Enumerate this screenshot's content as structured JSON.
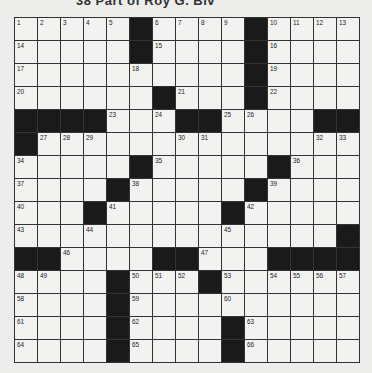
{
  "header": {
    "clue_text": "38 Part of Roy G. Biv"
  },
  "puzzle": {
    "rows": 15,
    "cols": 15,
    "grid": [
      [
        "1",
        "2",
        "3",
        "4",
        "5",
        "#",
        "6",
        "7",
        "8",
        "9",
        "#",
        "10",
        "11",
        "12",
        "13"
      ],
      [
        "14",
        "",
        "",
        "",
        "",
        "#",
        "15",
        "",
        "",
        "",
        "#",
        "16",
        "",
        "",
        ""
      ],
      [
        "17",
        "",
        "",
        "",
        "",
        "18",
        "",
        "",
        "",
        "",
        "#",
        "19",
        "",
        "",
        ""
      ],
      [
        "20",
        "",
        "",
        "",
        "",
        "",
        "#",
        "21",
        "",
        "",
        "#",
        "22",
        "",
        "",
        ""
      ],
      [
        "#",
        "#",
        "#",
        "#",
        "23",
        "",
        "24",
        "#",
        "#",
        "25",
        "26",
        "",
        "",
        "#",
        "#"
      ],
      [
        "#",
        "27",
        "28",
        "29",
        "",
        "",
        "",
        "30",
        "31",
        "",
        "",
        "",
        "",
        "32",
        "33"
      ],
      [
        "34",
        "",
        "",
        "",
        "",
        "#",
        "35",
        "",
        "",
        "",
        "",
        "#",
        "36",
        "",
        ""
      ],
      [
        "37",
        "",
        "",
        "",
        "#",
        "38",
        "",
        "",
        "",
        "",
        "#",
        "39",
        "",
        "",
        ""
      ],
      [
        "40",
        "",
        "",
        "#",
        "41",
        "",
        "",
        "",
        "",
        "#",
        "42",
        "",
        "",
        "",
        ""
      ],
      [
        "43",
        "",
        "",
        "44",
        "",
        "",
        "",
        "",
        "",
        "45",
        "",
        "",
        "",
        "",
        "#"
      ],
      [
        "#",
        "#",
        "46",
        "",
        "",
        "",
        "#",
        "#",
        "47",
        "",
        "",
        "#",
        "#",
        "#",
        "#"
      ],
      [
        "48",
        "49",
        "",
        "",
        "#",
        "50",
        "51",
        "52",
        "#",
        "53",
        "",
        "54",
        "55",
        "56",
        "57"
      ],
      [
        "58",
        "",
        "",
        "",
        "#",
        "59",
        "",
        "",
        "",
        "60",
        "",
        "",
        "",
        "",
        ""
      ],
      [
        "61",
        "",
        "",
        "",
        "#",
        "62",
        "",
        "",
        "",
        "#",
        "63",
        "",
        "",
        "",
        ""
      ],
      [
        "64",
        "",
        "",
        "",
        "#",
        "65",
        "",
        "",
        "",
        "#",
        "66",
        "",
        "",
        "",
        ""
      ]
    ]
  }
}
